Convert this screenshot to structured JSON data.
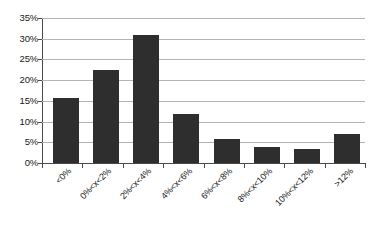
{
  "chart_data": {
    "type": "bar",
    "title": "",
    "subtitle": "",
    "xlabel": "",
    "ylabel": "",
    "categories": [
      "<0%",
      "0%<x<2%",
      "2%<x<4%",
      "4%<x<6%",
      "6%<x<8%",
      "8%<x<10%",
      "10%<x<12%",
      ">12%"
    ],
    "values": [
      15.8,
      22.5,
      31.0,
      11.8,
      5.9,
      3.9,
      3.3,
      7.0
    ],
    "value_labels": [
      "15.8%",
      "22.5%",
      "31.0%",
      "11.8%",
      "5.9%",
      "3.9%",
      "3.3%",
      "7.0%"
    ],
    "ylim": [
      0,
      35
    ],
    "ytick_values": [
      0,
      5,
      10,
      15,
      20,
      25,
      30,
      35
    ],
    "ytick_labels": [
      "0%",
      "5%",
      "10%",
      "15%",
      "20%",
      "25%",
      "30%",
      "35%"
    ],
    "grid": true,
    "grid_orientation": "horizontal",
    "legend": false,
    "legend_position": "none",
    "bar_color": "#2e2e2e",
    "grid_color": "#b4b4b4",
    "axis_color": "#4a4a4a",
    "background_color": "#ffffff",
    "xtick_label_rotation": -45
  }
}
